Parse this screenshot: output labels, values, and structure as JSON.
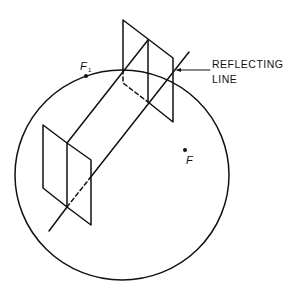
{
  "diagram": {
    "labels": {
      "reflecting_line_1": "REFLECTING",
      "reflecting_line_2": "LINE",
      "focus_1": "F",
      "focus_1_sub": "1",
      "focus": "F"
    },
    "colors": {
      "stroke": "#111111",
      "background": "#ffffff"
    }
  }
}
